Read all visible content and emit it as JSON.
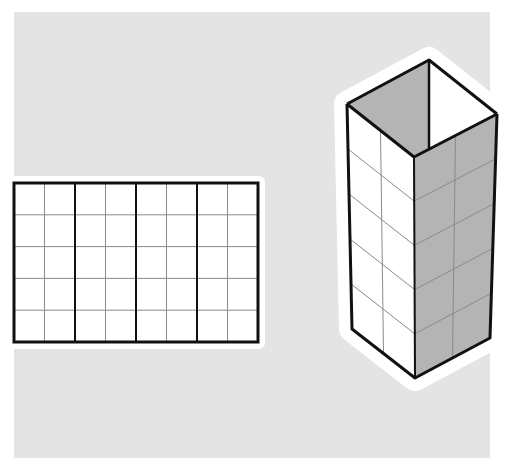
{
  "figure": {
    "background_color": "#e4e4e4",
    "halo_color": "#ffffff",
    "line_color": "#111111",
    "grid_line_color": "#8a8a8a",
    "shaded_face_color": "#b4b4b4",
    "light_face_color": "#ffffff"
  },
  "net": {
    "description": "Flat net of the open box: 4 side faces laid out in a row",
    "columns": 8,
    "rows": 5,
    "faces": 4,
    "columns_per_face": 2
  },
  "box": {
    "description": "Open-top rectangular box (square base) in isometric view",
    "face_columns": 2,
    "face_rows": 5,
    "left_face": "white",
    "right_face": "gray"
  }
}
